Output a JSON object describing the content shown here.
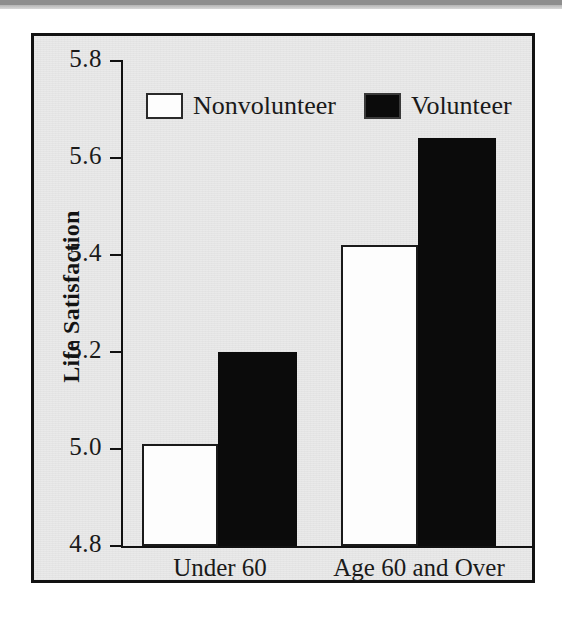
{
  "figure": {
    "frame_color": "#121212",
    "background_color": "#e9e9e9"
  },
  "legend": {
    "position": "top-center-inside",
    "entries": [
      {
        "label": "Nonvolunteer",
        "swatch": "white-square-outline-icon",
        "color": "#ffffff"
      },
      {
        "label": "Volunteer",
        "swatch": "black-square-filled-icon",
        "color": "#000000"
      }
    ]
  },
  "axes": {
    "y_title": "Life Satisfaction",
    "y_ticks": [
      "5.8",
      "5.6",
      "5.4",
      "5.2",
      "5.0",
      "4.8"
    ],
    "x_categories": [
      "Under 60",
      "Age 60 and Over"
    ]
  },
  "chart_data": {
    "type": "bar",
    "title": "",
    "subtitle": "",
    "xlabel": "",
    "ylabel": "Life Satisfaction",
    "categories": [
      "Under 60",
      "Age 60 and Over"
    ],
    "series": [
      {
        "name": "Nonvolunteer",
        "color": "#ffffff",
        "values": [
          5.01,
          5.42
        ]
      },
      {
        "name": "Volunteer",
        "color": "#000000",
        "values": [
          5.2,
          5.64
        ]
      }
    ],
    "ylim": [
      4.8,
      5.8
    ],
    "ytick_values": [
      4.8,
      5.0,
      5.2,
      5.4,
      5.6,
      5.8
    ],
    "ytick_labels": [
      "4.8",
      "5.0",
      "5.2",
      "5.4",
      "5.6",
      "5.8"
    ],
    "grid": false,
    "legend_position": "upper center",
    "annotations": []
  }
}
